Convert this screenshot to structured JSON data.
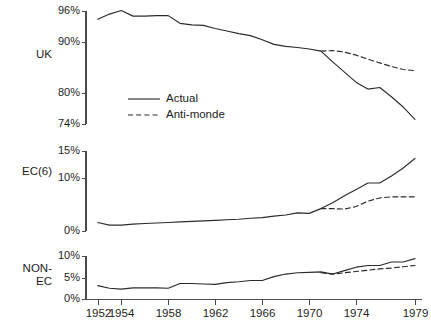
{
  "figure": {
    "background": "#ffffff",
    "line_color": "#2b2b2b",
    "axis_color": "#4a4a4a",
    "top_fragment": "",
    "legend": {
      "actual_label": "Actual",
      "antimonde_label": "Anti-monde"
    }
  },
  "xaxis": {
    "ticks": [
      1952,
      1954,
      1958,
      1962,
      1966,
      1970,
      1974,
      1979
    ],
    "tick_labels": [
      "1952",
      "1954",
      "1958",
      "1962",
      "1966",
      "1970",
      "1974",
      "1979"
    ],
    "min": 1951,
    "max": 1979.6
  },
  "panels": [
    {
      "key": "uk",
      "row_label": "UK",
      "ytick_labels": [
        "96%",
        "90%",
        "80%",
        "74%"
      ],
      "ylim": [
        73.2,
        96.9
      ]
    },
    {
      "key": "ec6",
      "row_label": "EC(6)",
      "ytick_labels": [
        "15%",
        "10%",
        "0%"
      ],
      "ylim": [
        -0.5,
        15.6
      ]
    },
    {
      "key": "nonec",
      "row_label": "NON-\nEC",
      "ytick_labels": [
        "10%",
        "5%",
        "0%"
      ],
      "ylim": [
        -0.3,
        10.4
      ]
    }
  ],
  "chart_data": [
    {
      "type": "line",
      "title": "UK",
      "xlabel": "",
      "ylabel": "UK",
      "ylim": [
        73.2,
        96.9
      ],
      "yticks": [
        96,
        90,
        80,
        74
      ],
      "ytick_labels": [
        "96%",
        "90%",
        "80%",
        "74%"
      ],
      "xlim": [
        1951,
        1979.6
      ],
      "xticks": [
        1952,
        1954,
        1958,
        1962,
        1966,
        1970,
        1974,
        1979
      ],
      "grid": false,
      "legend": [
        "Actual",
        "Anti-monde"
      ],
      "legend_position": "inside-lower-left",
      "series": [
        {
          "name": "Actual",
          "style": "solid",
          "x": [
            1952,
            1953,
            1954,
            1955,
            1956,
            1957,
            1958,
            1959,
            1960,
            1961,
            1962,
            1963,
            1964,
            1965,
            1966,
            1967,
            1968,
            1969,
            1970,
            1971,
            1972,
            1973,
            1974,
            1975,
            1976,
            1977,
            1978,
            1979
          ],
          "values": [
            94.4,
            95.4,
            96.1,
            95.0,
            95.0,
            95.1,
            95.1,
            93.6,
            93.3,
            93.2,
            92.6,
            92.1,
            91.6,
            91.2,
            90.4,
            89.5,
            89.1,
            88.9,
            88.6,
            88.2,
            86.1,
            84.1,
            82.1,
            80.8,
            81.1,
            79.3,
            77.3,
            74.9
          ]
        },
        {
          "name": "Anti-monde",
          "style": "dashed",
          "x": [
            1971,
            1972,
            1973,
            1974,
            1975,
            1976,
            1977,
            1978,
            1979
          ],
          "values": [
            88.2,
            88.3,
            88.0,
            87.4,
            86.6,
            85.9,
            85.2,
            84.6,
            84.4
          ]
        }
      ]
    },
    {
      "type": "line",
      "title": "EC(6)",
      "xlabel": "",
      "ylabel": "EC(6)",
      "ylim": [
        -0.5,
        15.6
      ],
      "yticks": [
        15,
        10,
        0
      ],
      "ytick_labels": [
        "15%",
        "10%",
        "0%"
      ],
      "xlim": [
        1951,
        1979.6
      ],
      "xticks": [
        1952,
        1954,
        1958,
        1962,
        1966,
        1970,
        1974,
        1979
      ],
      "grid": false,
      "legend": [
        "Actual",
        "Anti-monde"
      ],
      "series": [
        {
          "name": "Actual",
          "style": "solid",
          "x": [
            1952,
            1953,
            1954,
            1955,
            1956,
            1957,
            1958,
            1959,
            1960,
            1961,
            1962,
            1963,
            1964,
            1965,
            1966,
            1967,
            1968,
            1969,
            1970,
            1971,
            1972,
            1973,
            1974,
            1975,
            1976,
            1977,
            1978,
            1979
          ],
          "values": [
            1.6,
            1.1,
            1.1,
            1.3,
            1.4,
            1.5,
            1.6,
            1.7,
            1.8,
            1.9,
            2.0,
            2.1,
            2.2,
            2.4,
            2.5,
            2.8,
            3.0,
            3.4,
            3.3,
            4.2,
            5.3,
            6.6,
            7.8,
            9.0,
            9.0,
            10.3,
            11.8,
            13.6
          ]
        },
        {
          "name": "Anti-monde",
          "style": "dashed",
          "x": [
            1971,
            1972,
            1973,
            1974,
            1975,
            1976,
            1977,
            1978,
            1979
          ],
          "values": [
            4.2,
            4.2,
            4.1,
            4.6,
            5.6,
            6.2,
            6.4,
            6.4,
            6.4
          ]
        }
      ]
    },
    {
      "type": "line",
      "title": "NON-EC",
      "xlabel": "",
      "ylabel": "NON-EC",
      "ylim": [
        -0.3,
        10.4
      ],
      "yticks": [
        10,
        5,
        0
      ],
      "ytick_labels": [
        "10%",
        "5%",
        "0%"
      ],
      "xlim": [
        1951,
        1979.6
      ],
      "xticks": [
        1952,
        1954,
        1958,
        1962,
        1966,
        1970,
        1974,
        1979
      ],
      "grid": false,
      "legend": [
        "Actual",
        "Anti-monde"
      ],
      "series": [
        {
          "name": "Actual",
          "style": "solid",
          "x": [
            1952,
            1953,
            1954,
            1955,
            1956,
            1957,
            1958,
            1959,
            1960,
            1961,
            1962,
            1963,
            1964,
            1965,
            1966,
            1967,
            1968,
            1969,
            1970,
            1971,
            1972,
            1973,
            1974,
            1975,
            1976,
            1977,
            1978,
            1979
          ],
          "values": [
            3.1,
            2.5,
            2.3,
            2.6,
            2.6,
            2.6,
            2.5,
            3.6,
            3.6,
            3.5,
            3.4,
            3.8,
            4.0,
            4.3,
            4.3,
            5.2,
            5.8,
            6.1,
            6.2,
            6.3,
            5.8,
            6.6,
            7.4,
            7.8,
            7.8,
            8.6,
            8.6,
            9.4
          ]
        },
        {
          "name": "Anti-monde",
          "style": "dashed",
          "x": [
            1971,
            1972,
            1973,
            1974,
            1975,
            1976,
            1977,
            1978,
            1979
          ],
          "values": [
            6.1,
            5.8,
            6.1,
            6.4,
            6.7,
            7.0,
            7.2,
            7.5,
            7.8
          ]
        }
      ]
    }
  ]
}
